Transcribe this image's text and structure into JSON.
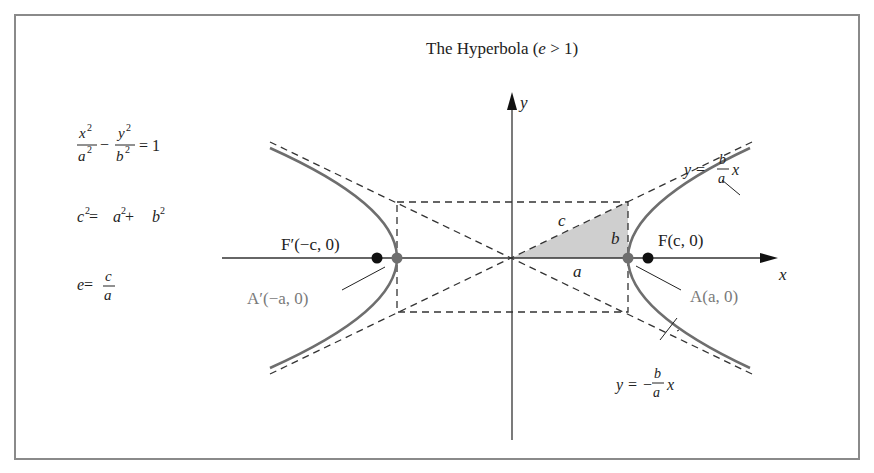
{
  "title": {
    "prefix": "The Hyperbola (",
    "var": "e",
    "suffix": " > 1)"
  },
  "equations": {
    "standard_form": {
      "x_num": "x",
      "x_den": "a",
      "y_num": "y",
      "y_den": "b",
      "exp": "2",
      "minus": "−",
      "rhs": "= 1"
    },
    "focal_relation": {
      "lhs": "c",
      "exp": "2",
      "eq": " = ",
      "a": "a",
      "plus": " + ",
      "b": "b"
    },
    "eccentricity": {
      "lhs": "e",
      "eq": " = ",
      "num": "c",
      "den": "a"
    }
  },
  "axes": {
    "x_label": "x",
    "y_label": "y"
  },
  "labels": {
    "focus_left": "F′(−c, 0)",
    "focus_right": "F(c, 0)",
    "vertex_left": "A′(−a, 0)",
    "vertex_right": "A(a, 0)",
    "segment_a": "a",
    "segment_b": "b",
    "segment_c": "c",
    "asymptote_pos": {
      "lhs": "y = ",
      "num": "b",
      "den": "a",
      "var": "x"
    },
    "asymptote_neg": {
      "lhs": "y = − ",
      "num": "b",
      "den": "a",
      "var": "x"
    }
  },
  "colors": {
    "curve": "#6e6e6e",
    "axis": "#333333",
    "dash": "#333333",
    "triangle_fill": "#cfcfcf",
    "vertex_dot": "#6e6e6e",
    "focus_dot": "#111111",
    "frame": "#8a8a8a"
  }
}
